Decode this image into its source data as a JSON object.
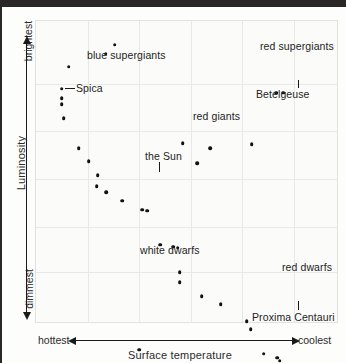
{
  "chart_data": {
    "type": "scatter",
    "title": "",
    "subtitle": "",
    "xlabel": "Surface temperature",
    "ylabel": "Luminosity",
    "x_axis_left_label": "hottest",
    "x_axis_right_label": "coolest",
    "y_axis_top_label": "brightest",
    "y_axis_bottom_label": "dimmest",
    "grid": true,
    "legend_position": "none",
    "xlim": [
      0,
      100
    ],
    "ylim": [
      0,
      100
    ],
    "x_gridlines": [
      17.2,
      34.3,
      51.5,
      68.6,
      85.8
    ],
    "y_gridlines": [
      16.5,
      31.7,
      47.5,
      63.4,
      79.2
    ],
    "note": "Hertzsprung-Russell diagram; axes are qualitative (hottest to coolest, brightest to dimmest)",
    "points": [
      {
        "x": 10.9,
        "y": 84.8
      },
      {
        "x": 8.6,
        "y": 77.5
      },
      {
        "x": 8.6,
        "y": 74.3
      },
      {
        "x": 8.6,
        "y": 72.3
      },
      {
        "x": 9.2,
        "y": 67.7
      },
      {
        "x": 14.2,
        "y": 57.8
      },
      {
        "x": 17.5,
        "y": 53.5
      },
      {
        "x": 20.5,
        "y": 48.8
      },
      {
        "x": 20.2,
        "y": 45.2
      },
      {
        "x": 23.4,
        "y": 43.2
      },
      {
        "x": 28.7,
        "y": 40.3
      },
      {
        "x": 35.3,
        "y": 37.3
      },
      {
        "x": 36.9,
        "y": 37.0
      },
      {
        "x": 41.3,
        "y": 25.7
      },
      {
        "x": 45.5,
        "y": 25.0
      },
      {
        "x": 47.1,
        "y": 24.7
      },
      {
        "x": 47.8,
        "y": 16.5
      },
      {
        "x": 47.8,
        "y": 13.2
      },
      {
        "x": 55.1,
        "y": 8.6
      },
      {
        "x": 61.4,
        "y": 5.9
      },
      {
        "x": 70.0,
        "y": 0.3
      },
      {
        "x": 71.3,
        "y": -2.4
      },
      {
        "x": 75.6,
        "y": -10.6
      },
      {
        "x": 80.2,
        "y": -11.9
      },
      {
        "x": 80.9,
        "y": -12.9
      },
      {
        "x": 82.5,
        "y": -19.1
      },
      {
        "x": 86.5,
        "y": -19.4
      },
      {
        "x": 87.8,
        "y": -20.1
      },
      {
        "x": 78.9,
        "y": -21.4
      },
      {
        "x": 83.5,
        "y": -23.4
      },
      {
        "x": 85.5,
        "y": -23.8
      },
      {
        "x": 86.1,
        "y": -25.1
      },
      {
        "x": 34.3,
        "y": -9.2
      },
      {
        "x": 37.6,
        "y": -15.5
      },
      {
        "x": 48.8,
        "y": 59.4
      },
      {
        "x": 57.8,
        "y": 57.8
      },
      {
        "x": 53.5,
        "y": 52.8
      },
      {
        "x": 71.6,
        "y": 59.1
      },
      {
        "x": 79.9,
        "y": 76.2
      },
      {
        "x": 82.2,
        "y": 76.2
      },
      {
        "x": 23.1,
        "y": 89.1
      },
      {
        "x": 26.1,
        "y": 92.1
      }
    ],
    "annotations": [
      {
        "label": "blue supergiants",
        "x": 84,
        "y": 41
      },
      {
        "label": "Spica",
        "x": 73,
        "y": 74,
        "leader": "horizontal"
      },
      {
        "label": "red giants",
        "x": 190,
        "y": 102
      },
      {
        "label": "the Sun",
        "x": 142,
        "y": 142,
        "leader": "vertical"
      },
      {
        "label": "white dwarfs",
        "x": 137,
        "y": 236
      },
      {
        "label": "red supergiants",
        "x": 257,
        "y": 32
      },
      {
        "label": "Betelgeuse",
        "x": 253,
        "y": 80,
        "leader": "vertical"
      },
      {
        "label": "red dwarfs",
        "x": 279,
        "y": 253
      },
      {
        "label": "Proxima Centauri",
        "x": 249,
        "y": 303,
        "leader": "vertical"
      }
    ]
  },
  "axes": {
    "y_title": "Luminosity",
    "y_top": "brightest",
    "y_bottom": "dimmest",
    "x_title": "Surface temperature",
    "x_left": "hottest",
    "x_right": "coolest"
  }
}
